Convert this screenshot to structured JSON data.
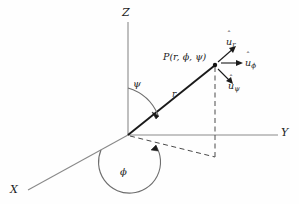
{
  "figure": {
    "type": "spherical-coordinate-diagram",
    "background_color": "#fefefe",
    "axis_color": "#8a8a8a",
    "line_color": "#222222",
    "dash_color": "#555555",
    "label_color": "#1c1c1c"
  },
  "axes": [
    {
      "name": "z-axis",
      "label": "Z",
      "from": [
        128,
        135
      ],
      "to": [
        128,
        22
      ]
    },
    {
      "name": "y-axis",
      "label": "Y",
      "from": [
        128,
        135
      ],
      "to": [
        278,
        135
      ]
    },
    {
      "name": "x-axis",
      "label": "X",
      "from": [
        128,
        135
      ],
      "to": [
        28,
        190
      ]
    }
  ],
  "point": {
    "label": "P(r, ϕ, ψ)",
    "coords": [
      215,
      65
    ]
  },
  "radial_line": {
    "label": "r",
    "from": [
      128,
      135
    ],
    "to": [
      215,
      65
    ]
  },
  "angles": [
    {
      "name": "psi",
      "label": "ψ",
      "description": "polar angle from Z axis to r"
    },
    {
      "name": "phi",
      "label": "ϕ",
      "description": "azimuthal angle from X axis to projection of r"
    }
  ],
  "unit_vectors": [
    {
      "name": "u-r",
      "hat": "ˆ",
      "base": "u",
      "sub": "r",
      "label": "û_r"
    },
    {
      "name": "u-phi",
      "hat": "ˆ",
      "base": "u",
      "sub": "ϕ",
      "label": "û_ϕ"
    },
    {
      "name": "u-psi",
      "hat": "ˆ",
      "base": "u",
      "sub": "ψ",
      "label": "û_ψ"
    }
  ],
  "projection": {
    "name": "xy-projection",
    "from": [
      128,
      135
    ],
    "to": [
      215,
      157
    ],
    "vertical_from": [
      215,
      157
    ],
    "vertical_to": [
      215,
      65
    ]
  }
}
